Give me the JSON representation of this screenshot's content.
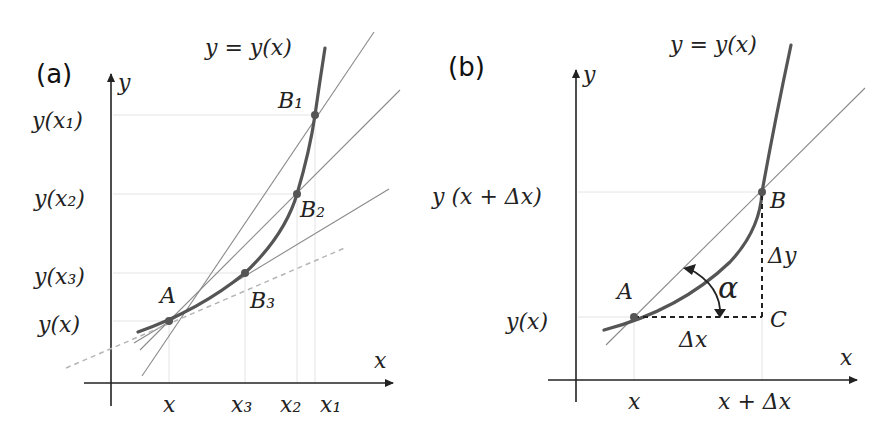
{
  "panel_a": {
    "label": "(a)",
    "curve_label": "y = y(x)",
    "axis_x": "x",
    "axis_y": "y",
    "y_ticks": [
      "y(x₁)",
      "y(x₂)",
      "y(x₃)",
      "y(x)"
    ],
    "x_ticks": [
      "x",
      "x₃",
      "x₂",
      "x₁"
    ],
    "points": {
      "A": "A",
      "B1": "B₁",
      "B2": "B₂",
      "B3": "B₃"
    }
  },
  "panel_b": {
    "label": "(b)",
    "curve_label": "y = y(x)",
    "axis_x": "x",
    "axis_y": "y",
    "y_ticks": [
      "y (x + Δx)",
      "y(x)"
    ],
    "x_ticks": [
      "x",
      "x + Δx"
    ],
    "points": {
      "A": "A",
      "B": "B",
      "C": "C"
    },
    "delta_x": "Δx",
    "delta_y": "Δy",
    "angle": "α"
  }
}
